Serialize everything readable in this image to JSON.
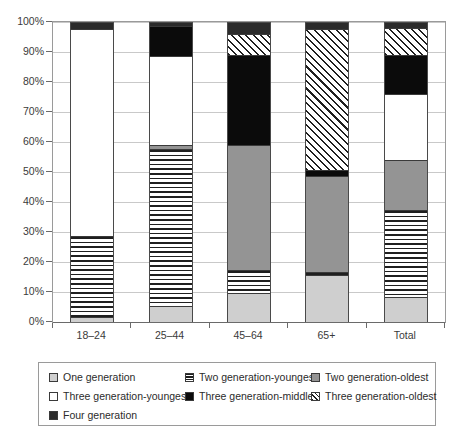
{
  "chart_data": {
    "type": "bar",
    "stacked": true,
    "normalized_percent": true,
    "title": "",
    "subtitle": "",
    "xlabel": "",
    "ylabel": "",
    "ylim": [
      0,
      100
    ],
    "grid": true,
    "legend_position": "bottom",
    "categories": [
      "18–24",
      "25–44",
      "45–64",
      "65+",
      "Total"
    ],
    "ytick_labels": [
      "0%",
      "10%",
      "20%",
      "30%",
      "40%",
      "50%",
      "60%",
      "70%",
      "80%",
      "90%",
      "100%"
    ],
    "ytick_values": [
      0,
      10,
      20,
      30,
      40,
      50,
      60,
      70,
      80,
      90,
      100
    ],
    "series": [
      {
        "name": "One generation",
        "key": "one",
        "fill": "solid-light-gray",
        "color": "#cfcfcf",
        "values": [
          1.5,
          5.0,
          9.5,
          15.5,
          8.0
        ]
      },
      {
        "name": "Two generation-youngest",
        "key": "twoy",
        "fill": "horizontal-stripes",
        "color": "#1f1f1f",
        "values": [
          27.0,
          52.5,
          7.5,
          1.0,
          29.0
        ]
      },
      {
        "name": "Two generation-oldest",
        "key": "twoo",
        "fill": "solid-mid-gray",
        "color": "#949494",
        "values": [
          0.0,
          1.5,
          42.0,
          32.0,
          17.0
        ]
      },
      {
        "name": "Three generation-youngest",
        "key": "threey",
        "fill": "solid-white",
        "color": "#ffffff",
        "values": [
          69.0,
          29.5,
          0.0,
          0.0,
          22.0
        ]
      },
      {
        "name": "Three generation-middle",
        "key": "threem",
        "fill": "solid-black",
        "color": "#0b0b0b",
        "values": [
          0.0,
          10.0,
          30.0,
          2.0,
          13.0
        ]
      },
      {
        "name": "Three generation-oldest",
        "key": "threeo",
        "fill": "diagonal-hatch",
        "color": "#1f1f1f",
        "values": [
          0.0,
          0.0,
          7.0,
          47.0,
          9.0
        ]
      },
      {
        "name": "Four generation",
        "key": "four",
        "fill": "solid-dark-gray",
        "color": "#2b2b2b",
        "values": [
          2.5,
          1.5,
          4.0,
          2.5,
          2.0
        ]
      }
    ]
  },
  "legend": {
    "items": [
      {
        "label": "One generation",
        "swatch": "one-generation-swatch"
      },
      {
        "label": "Two generation-youngest",
        "swatch": "two-generation-youngest-swatch"
      },
      {
        "label": "Two generation-oldest",
        "swatch": "two-generation-oldest-swatch"
      },
      {
        "label": "Three generation-youngest",
        "swatch": "three-generation-youngest-swatch"
      },
      {
        "label": "Three generation-middle",
        "swatch": "three-generation-middle-swatch"
      },
      {
        "label": "Three generation-oldest",
        "swatch": "three-generation-oldest-swatch"
      },
      {
        "label": "Four generation",
        "swatch": "four-generation-swatch"
      }
    ]
  }
}
